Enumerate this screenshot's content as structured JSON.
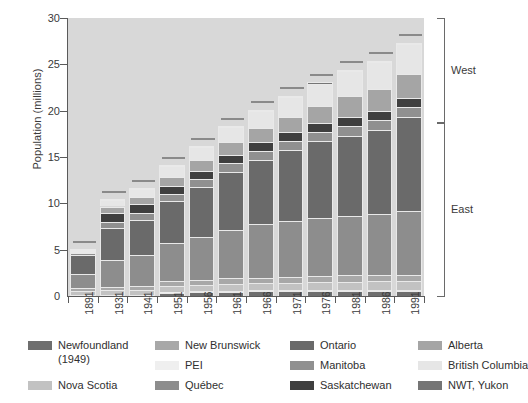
{
  "chart_data": {
    "type": "bar",
    "stacked": true,
    "title": "",
    "xlabel": "",
    "ylabel": "Population (millions)",
    "ylim": [
      0,
      30
    ],
    "yticks": [
      0,
      5,
      10,
      15,
      20,
      25,
      30
    ],
    "grid": false,
    "legend_position": "below",
    "categories": [
      "1891",
      "1931",
      "1941",
      "1951",
      "1956",
      "1961",
      "1966",
      "1971",
      "1976",
      "1981",
      "1986",
      "1991"
    ],
    "totals": [
      4.83,
      10.38,
      11.51,
      14.01,
      16.08,
      18.24,
      20.01,
      21.57,
      22.99,
      24.34,
      25.31,
      27.3
    ],
    "series": [
      {
        "name": "Newfoundland (1949)",
        "color": "#6e6e6e",
        "values": [
          0.0,
          0.0,
          0.0,
          0.36,
          0.42,
          0.46,
          0.49,
          0.52,
          0.56,
          0.57,
          0.57,
          0.57
        ]
      },
      {
        "name": "PEI",
        "color": "#efefef",
        "values": [
          0.11,
          0.09,
          0.09,
          0.1,
          0.1,
          0.1,
          0.11,
          0.11,
          0.12,
          0.12,
          0.13,
          0.13
        ]
      },
      {
        "name": "Nova Scotia",
        "color": "#c2c2c2",
        "values": [
          0.45,
          0.51,
          0.58,
          0.64,
          0.69,
          0.74,
          0.76,
          0.79,
          0.83,
          0.85,
          0.87,
          0.9
        ]
      },
      {
        "name": "New Brunswick",
        "color": "#a8a8a8",
        "values": [
          0.32,
          0.41,
          0.46,
          0.51,
          0.55,
          0.6,
          0.62,
          0.63,
          0.68,
          0.7,
          0.71,
          0.72
        ]
      },
      {
        "name": "Québec",
        "color": "#8d8d8d",
        "values": [
          1.49,
          2.87,
          3.33,
          4.06,
          4.63,
          5.26,
          5.78,
          6.03,
          6.23,
          6.44,
          6.54,
          6.9
        ]
      },
      {
        "name": "Ontario",
        "color": "#6a6a6a",
        "values": [
          2.11,
          3.43,
          3.79,
          4.6,
          5.4,
          6.24,
          6.96,
          7.7,
          8.26,
          8.63,
          9.1,
          10.08
        ]
      },
      {
        "name": "Manitoba",
        "color": "#909090",
        "values": [
          0.15,
          0.7,
          0.73,
          0.78,
          0.85,
          0.92,
          0.96,
          0.99,
          1.02,
          1.03,
          1.07,
          1.09
        ]
      },
      {
        "name": "Saskatchewan",
        "color": "#3f3f3f",
        "values": [
          0.09,
          0.92,
          0.9,
          0.83,
          0.88,
          0.93,
          0.96,
          0.93,
          0.92,
          0.97,
          1.01,
          0.99
        ]
      },
      {
        "name": "Alberta",
        "color": "#a5a5a5",
        "values": [
          0.1,
          0.73,
          0.8,
          0.94,
          1.12,
          1.33,
          1.46,
          1.63,
          1.84,
          2.24,
          2.37,
          2.55
        ]
      },
      {
        "name": "British Columbia",
        "color": "#e6e6e6",
        "values": [
          0.1,
          0.69,
          0.82,
          1.17,
          1.4,
          1.63,
          1.87,
          2.18,
          2.47,
          2.74,
          2.89,
          3.28
        ]
      },
      {
        "name": "NWT, Yukon",
        "color": "#757575",
        "values": [
          0.01,
          0.02,
          0.02,
          0.03,
          0.04,
          0.04,
          0.05,
          0.06,
          0.07,
          0.07,
          0.08,
          0.09
        ]
      }
    ],
    "annotations": [
      {
        "label": "West",
        "type": "bracket"
      },
      {
        "label": "East",
        "type": "bracket"
      }
    ]
  },
  "axes": {
    "y": {
      "label": "Population (millions)",
      "ticks": [
        "0",
        "5",
        "10",
        "15",
        "20",
        "25",
        "30"
      ]
    },
    "x": {
      "ticks": [
        "1891",
        "1931",
        "1941",
        "1951",
        "1956",
        "1961",
        "1966",
        "1971",
        "1976",
        "1981",
        "1986",
        "1991"
      ]
    }
  },
  "regions": {
    "west": "West",
    "east": "East"
  },
  "legend": {
    "columns": [
      {
        "items": [
          {
            "label": "Newfoundland",
            "label2": "(1949)",
            "color": "#6e6e6e"
          },
          {
            "label": "Nova Scotia",
            "label2": "",
            "color": "#c2c2c2"
          }
        ]
      },
      {
        "items": [
          {
            "label": "New Brunswick",
            "label2": "",
            "color": "#a8a8a8"
          },
          {
            "label": "PEI",
            "label2": "",
            "color": "#efefef"
          },
          {
            "label": "Québec",
            "label2": "",
            "color": "#8d8d8d"
          }
        ]
      },
      {
        "items": [
          {
            "label": "Ontario",
            "label2": "",
            "color": "#6a6a6a"
          },
          {
            "label": "Manitoba",
            "label2": "",
            "color": "#909090"
          },
          {
            "label": "Saskatchewan",
            "label2": "",
            "color": "#3f3f3f"
          }
        ]
      },
      {
        "items": [
          {
            "label": "Alberta",
            "label2": "",
            "color": "#a5a5a5"
          },
          {
            "label": "British Columbia",
            "label2": "",
            "color": "#e6e6e6"
          },
          {
            "label": "NWT, Yukon",
            "label2": "",
            "color": "#757575"
          }
        ]
      }
    ]
  },
  "colors": {
    "plot_background": "#d8d8d8",
    "page_background": "#ffffff",
    "axis": "#5a5a5a",
    "text": "#333333"
  }
}
